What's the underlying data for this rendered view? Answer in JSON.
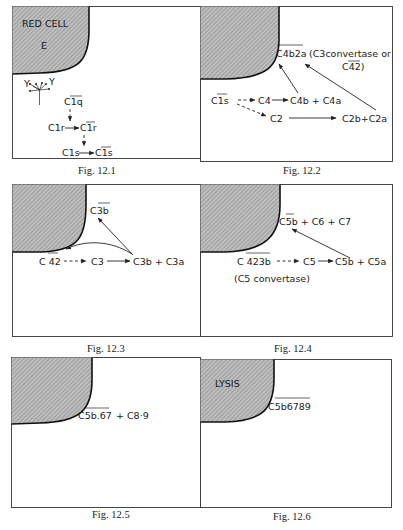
{
  "figures": [
    {
      "caption": "Fig. 12.1",
      "cell_label": "RED CELL",
      "cell_sublabel": "E",
      "antibody_labels": [
        "Y",
        "Y"
      ],
      "nodes": {
        "c1q": "C1q",
        "c1r": "C1r",
        "c1r_act": "C1r",
        "c1s": "C1s",
        "c1s_act": "C1s"
      },
      "overbars": [
        "C1q",
        "C1r active",
        "C1s active"
      ]
    },
    {
      "caption": "Fig. 12.2",
      "nodes": {
        "c1s_act": "C1s",
        "c4": "C4",
        "c4b_c4a": "C4b + C4a",
        "c2": "C2",
        "c2b_c2a": "C2b+C2a",
        "c4b2a": "C4b2a",
        "note_line1": "(C3convertase or",
        "note_line2": "C42)"
      }
    },
    {
      "caption": "Fig. 12.3",
      "nodes": {
        "c42": "C 42",
        "c3": "C3",
        "c3b_c3a": "C3b + C3a",
        "c3b_bound": "C3b"
      }
    },
    {
      "caption": "Fig. 12.4",
      "nodes": {
        "c423b": "C 423b",
        "c5": "C5",
        "c5b_c5a": "C5b + C5a",
        "c5b_c6_c7": "C5b + C6 + C7",
        "note": "(C5 convertase)"
      }
    },
    {
      "caption": "Fig. 12.5",
      "nodes": {
        "c5b67": "C5b.67",
        "c89": "+ C8·9"
      }
    },
    {
      "caption": "Fig. 12.6",
      "cell_label": "LYSIS",
      "nodes": {
        "c5b6789": "C5b6789"
      }
    }
  ]
}
